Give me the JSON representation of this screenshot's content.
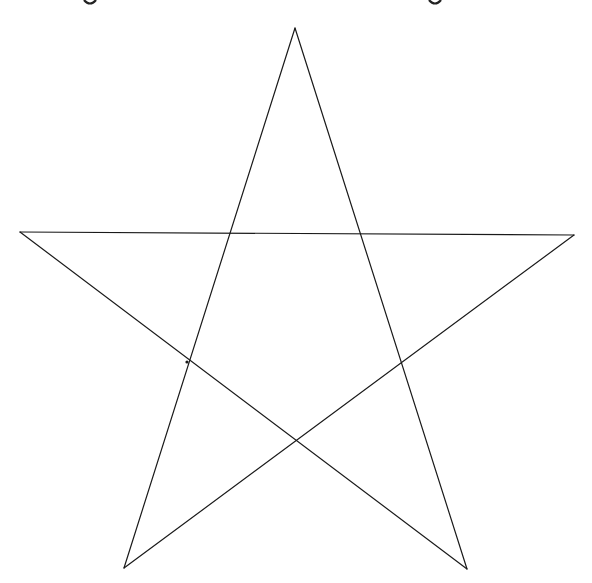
{
  "page": {
    "background": "#ffffff"
  },
  "figure": {
    "shape": "pentagram",
    "stroke_color": "#1a1a1a",
    "stroke_width": 1.2,
    "vertices": {
      "top": [
        295,
        28
      ],
      "left": [
        20,
        232
      ],
      "right": [
        574,
        235
      ],
      "bottom_left": [
        124,
        568
      ],
      "bottom_right": [
        467,
        569
      ]
    },
    "edges": [
      [
        "top",
        "bottom_left"
      ],
      [
        "top",
        "bottom_right"
      ],
      [
        "left",
        "right"
      ],
      [
        "left",
        "bottom_right"
      ],
      [
        "right",
        "bottom_left"
      ]
    ],
    "marked_intersection": [
      187,
      362
    ]
  },
  "cropped_text_fragments": [
    {
      "x": 90,
      "y": 0
    },
    {
      "x": 435,
      "y": 0
    }
  ]
}
